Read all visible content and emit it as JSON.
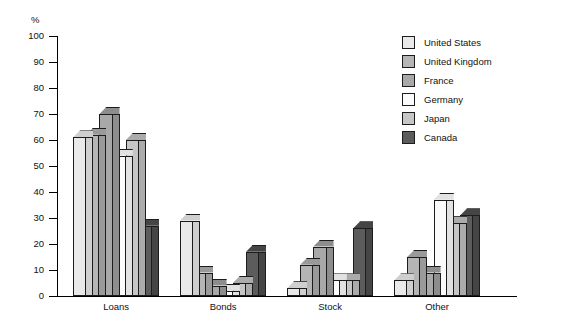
{
  "chart_data": {
    "type": "bar",
    "title": "",
    "subtitle": "",
    "xlabel": "",
    "ylabel": "%",
    "ylim": [
      0,
      100
    ],
    "yticks": [
      0,
      10,
      20,
      30,
      40,
      50,
      60,
      70,
      80,
      90,
      100
    ],
    "ytick_labels": [
      "0",
      "10",
      "20",
      "30",
      "40",
      "50",
      "60",
      "70",
      "80",
      "90",
      "100"
    ],
    "grid": false,
    "legend_position": "right",
    "categories": [
      "Loans",
      "Bonds",
      "Stock",
      "Other"
    ],
    "series": [
      {
        "name": "United States",
        "color": "#e9e9e9",
        "side_color": "#cfcfcf",
        "values": [
          61,
          29,
          3,
          6
        ]
      },
      {
        "name": "United Kingdom",
        "color": "#b5b5b5",
        "side_color": "#9a9a9a",
        "values": [
          62,
          9,
          12,
          15
        ]
      },
      {
        "name": "France",
        "color": "#a8a8a8",
        "side_color": "#8d8d8d",
        "values": [
          70,
          4,
          19,
          9
        ]
      },
      {
        "name": "Germany",
        "color": "#fbfbfb",
        "side_color": "#e2e2e2",
        "values": [
          54,
          2,
          6,
          37
        ]
      },
      {
        "name": "Japan",
        "color": "#c6c6c6",
        "side_color": "#ababab",
        "values": [
          60,
          5,
          6,
          28
        ]
      },
      {
        "name": "Canada",
        "color": "#5c5c5c",
        "side_color": "#454545",
        "values": [
          27,
          17,
          26,
          31
        ]
      }
    ]
  },
  "legend": {
    "items": [
      {
        "label": "United States"
      },
      {
        "label": "United Kingdom"
      },
      {
        "label": "France"
      },
      {
        "label": "Germany"
      },
      {
        "label": "Japan"
      },
      {
        "label": "Canada"
      }
    ]
  },
  "axis": {
    "unit_label": "%"
  }
}
